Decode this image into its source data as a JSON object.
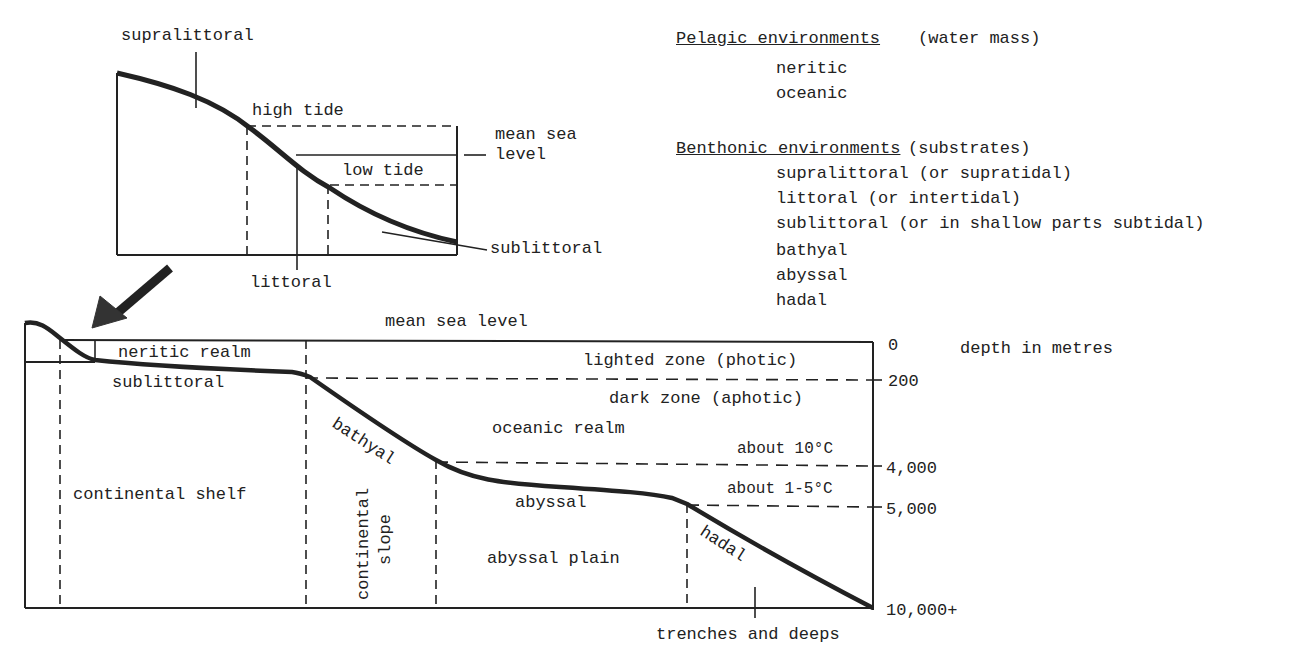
{
  "inset_diagram": {
    "labels": {
      "supralittoral": "supralittoral",
      "high_tide": "high tide",
      "mean_sea_level": "mean sea",
      "mean_sea_level_2": "level",
      "low_tide": "low tide",
      "littoral": "littoral",
      "sublittoral": "sublittoral"
    }
  },
  "legend": {
    "pelagic": {
      "heading": "Pelagic environments",
      "qualifier": "(water mass)",
      "items": [
        "neritic",
        "oceanic"
      ]
    },
    "benthonic": {
      "heading": "Benthonic environments",
      "qualifier": "(substrates)",
      "items": [
        "supralittoral (or supratidal)",
        "littoral (or intertidal)",
        "sublittoral (or in shallow parts subtidal)",
        "bathyal",
        "abyssal",
        "hadal"
      ]
    }
  },
  "main_diagram": {
    "mean_sea_level": "mean sea level",
    "neritic_realm": "neritic realm",
    "sublittoral": "sublittoral",
    "continental_shelf": "continental shelf",
    "bathyal": "bathyal",
    "continental_slope_1": "continental",
    "continental_slope_2": "slope",
    "oceanic_realm": "oceanic realm",
    "lighted_zone": "lighted zone (photic)",
    "dark_zone": "dark zone (aphotic)",
    "temp_10": "about 10°C",
    "temp_1_5": "about 1-5°C",
    "abyssal": "abyssal",
    "abyssal_plain": "abyssal plain",
    "hadal": "hadal",
    "trenches": "trenches and deeps",
    "depth_axis": {
      "title": "depth in metres",
      "ticks": [
        "0",
        "200",
        "4,000",
        "5,000",
        "10,000+"
      ]
    }
  }
}
